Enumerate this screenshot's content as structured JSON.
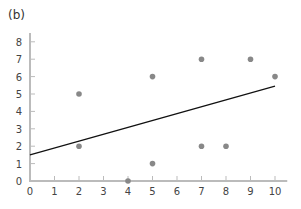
{
  "panel_label": "(b)",
  "chart_data": {
    "type": "scatter",
    "title": "",
    "xlabel": "",
    "ylabel": "",
    "xlim": [
      0,
      10.5
    ],
    "ylim": [
      0,
      8.7
    ],
    "grid": false,
    "xticks": [
      0,
      1,
      2,
      3,
      4,
      5,
      6,
      7,
      8,
      9,
      10
    ],
    "yticks": [
      0,
      1,
      2,
      3,
      4,
      5,
      6,
      7,
      8
    ],
    "points": [
      {
        "x": 2,
        "y": 5
      },
      {
        "x": 2,
        "y": 2
      },
      {
        "x": 4,
        "y": 0
      },
      {
        "x": 5,
        "y": 6
      },
      {
        "x": 5,
        "y": 1
      },
      {
        "x": 7,
        "y": 7
      },
      {
        "x": 7,
        "y": 2
      },
      {
        "x": 8,
        "y": 2
      },
      {
        "x": 9,
        "y": 7
      },
      {
        "x": 10,
        "y": 6
      }
    ],
    "fit_line": {
      "x0": 0,
      "y0": 1.5,
      "x1": 10,
      "y1": 5.45
    },
    "colors": {
      "points": "#888888",
      "line": "#111111",
      "axis": "#bbbbbb"
    }
  }
}
